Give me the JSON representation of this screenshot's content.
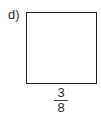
{
  "problem": {
    "label": "d)",
    "shape": "square",
    "side_length": {
      "numerator": "3",
      "denominator": "8"
    }
  }
}
